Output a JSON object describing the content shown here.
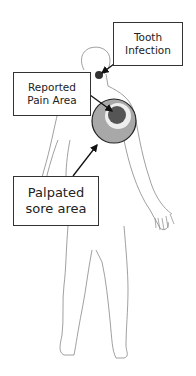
{
  "diagram": {
    "type": "anatomical-body-outline",
    "labels": {
      "tooth_infection": {
        "line1": "Tooth",
        "line2": "Infection"
      },
      "reported_pain": {
        "line1": "Reported",
        "line2": "Pain Area"
      },
      "palpated_sore": {
        "line1": "Palpated",
        "line2": "sore area"
      }
    },
    "colors": {
      "outline": "#888888",
      "tooth_dot": "#333333",
      "outer_circle": "#a8a8a8",
      "ring": "#eeeeee",
      "inner_circle": "#555555",
      "arrow": "#111111"
    }
  }
}
